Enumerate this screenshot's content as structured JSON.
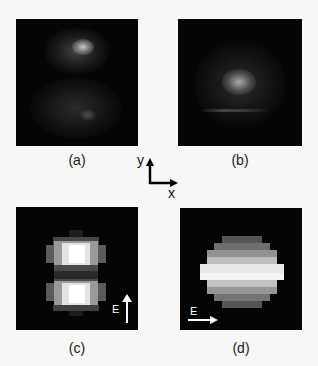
{
  "figure": {
    "panels": [
      {
        "id": "a",
        "label": "(a)",
        "description": "Measured speckled two-lobe intensity pattern, bright upper lobe, dimmer lower lobe"
      },
      {
        "id": "b",
        "label": "(b)",
        "description": "Measured diffuse central intensity pattern with faint horizontal streak"
      },
      {
        "id": "c",
        "label": "(c)",
        "description": "Simulated pixelated two-lobe pattern, vertical",
        "field_label": "E",
        "field_direction": "up"
      },
      {
        "id": "d",
        "label": "(d)",
        "description": "Simulated pixelated horizontally banded elliptical pattern",
        "field_label": "E",
        "field_direction": "right"
      }
    ],
    "axes": {
      "y_label": "y",
      "x_label": "x"
    }
  }
}
